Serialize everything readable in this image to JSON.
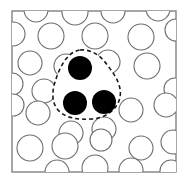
{
  "figure": {
    "background_color": "#ffffff"
  },
  "box": {
    "name": "outer-box",
    "x": 12,
    "y": 11,
    "width": 164,
    "height": 161,
    "stroke_color": "#808080",
    "stroke_width": 1.4,
    "fill_color": "#ffffff"
  },
  "open_circles": {
    "stroke_color": "#6e6e6e",
    "stroke_width": 1.1,
    "fill_color": "#ffffff",
    "items": [
      {
        "cx": 36,
        "cy": 10,
        "r": 12
      },
      {
        "cx": 75,
        "cy": 12,
        "r": 13
      },
      {
        "cx": 113,
        "cy": 11,
        "r": 12
      },
      {
        "cx": 158,
        "cy": 9,
        "r": 12
      },
      {
        "cx": 13,
        "cy": 34,
        "r": 12
      },
      {
        "cx": 51,
        "cy": 36,
        "r": 13
      },
      {
        "cx": 95,
        "cy": 36,
        "r": 13
      },
      {
        "cx": 141,
        "cy": 37,
        "r": 13
      },
      {
        "cx": 176,
        "cy": 30,
        "r": 11
      },
      {
        "cx": 30,
        "cy": 63,
        "r": 12
      },
      {
        "cx": 66,
        "cy": 66,
        "r": 12
      },
      {
        "cx": 108,
        "cy": 62,
        "r": 12
      },
      {
        "cx": 147,
        "cy": 66,
        "r": 13
      },
      {
        "cx": 12,
        "cy": 84,
        "r": 11
      },
      {
        "cx": 44,
        "cy": 91,
        "r": 12
      },
      {
        "cx": 175,
        "cy": 89,
        "r": 11
      },
      {
        "cx": 13,
        "cy": 105,
        "r": 11
      },
      {
        "cx": 38,
        "cy": 113,
        "r": 12
      },
      {
        "cx": 131,
        "cy": 110,
        "r": 12
      },
      {
        "cx": 166,
        "cy": 105,
        "r": 12
      },
      {
        "cx": 71,
        "cy": 133,
        "r": 12
      },
      {
        "cx": 104,
        "cy": 129,
        "r": 12
      },
      {
        "cx": 30,
        "cy": 148,
        "r": 13
      },
      {
        "cx": 65,
        "cy": 146,
        "r": 13
      },
      {
        "cx": 101,
        "cy": 140,
        "r": 11
      },
      {
        "cx": 141,
        "cy": 148,
        "r": 12
      },
      {
        "cx": 173,
        "cy": 142,
        "r": 12
      },
      {
        "cx": 57,
        "cy": 172,
        "r": 12
      },
      {
        "cx": 95,
        "cy": 168,
        "r": 13
      },
      {
        "cx": 131,
        "cy": 170,
        "r": 12
      },
      {
        "cx": 171,
        "cy": 171,
        "r": 11
      }
    ]
  },
  "filled_circles": {
    "fill_color": "#000000",
    "items": [
      {
        "cx": 80,
        "cy": 68,
        "r": 12,
        "label": "top-particle"
      },
      {
        "cx": 75,
        "cy": 103,
        "r": 12,
        "label": "bottom-left-particle"
      },
      {
        "cx": 104,
        "cy": 102,
        "r": 12,
        "label": "bottom-right-particle"
      }
    ]
  },
  "dashed_contour": {
    "stroke_color": "#1a1a1a",
    "stroke_width": 1.6,
    "dash_pattern": "4 3",
    "path": "M 80 50 C 92 49 101 56 108 66 C 116 76 122 87 120 97 C 118 109 106 118 92 119 C 78 120 65 118 58 110 C 51 102 52 90 56 79 C 60 67 67 52 80 50 Z"
  }
}
